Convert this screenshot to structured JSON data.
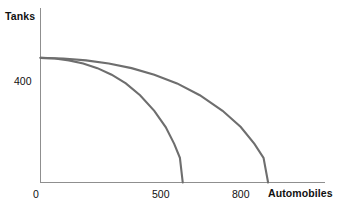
{
  "chart_data": {
    "type": "line",
    "title": "",
    "subtitle": "",
    "xlabel": "Automobiles",
    "ylabel": "Tanks",
    "xlim": [
      0,
      1000
    ],
    "ylim": [
      0,
      560
    ],
    "grid": false,
    "legend_position": "none",
    "x_tick_labels": [
      "0",
      "500",
      "800"
    ],
    "x_tick_values": [
      0,
      500,
      800
    ],
    "y_tick_labels": [
      "400"
    ],
    "y_tick_values": [
      400
    ],
    "annotations": [],
    "series": [
      {
        "name": "inner-ppf",
        "color": "#6e6e6e",
        "shape": "concave-to-origin",
        "y_intercept": 400,
        "x_intercept": 500,
        "x": [
          0,
          50,
          100,
          150,
          200,
          250,
          300,
          350,
          400,
          440,
          470,
          490,
          500
        ],
        "values": [
          400,
          398,
          392,
          382,
          367,
          346,
          318,
          280,
          230,
          178,
          124,
          79,
          0
        ]
      },
      {
        "name": "outer-ppf",
        "color": "#6e6e6e",
        "shape": "concave-to-origin",
        "y_intercept": 400,
        "x_intercept": 800,
        "x": [
          0,
          80,
          160,
          240,
          320,
          400,
          480,
          560,
          640,
          704,
          752,
          784,
          800
        ],
        "values": [
          400,
          398,
          392,
          382,
          367,
          346,
          318,
          280,
          230,
          178,
          124,
          79,
          0
        ]
      }
    ]
  },
  "labels": {
    "y_axis_title": "Tanks",
    "x_axis_title": "Automobiles",
    "y_tick_400": "400",
    "x_tick_0": "0",
    "x_tick_500": "500",
    "x_tick_800": "800"
  },
  "colors": {
    "curve": "#6e6e6e",
    "axis": "#8f8f8f",
    "text": "#111111",
    "background": "#ffffff"
  }
}
